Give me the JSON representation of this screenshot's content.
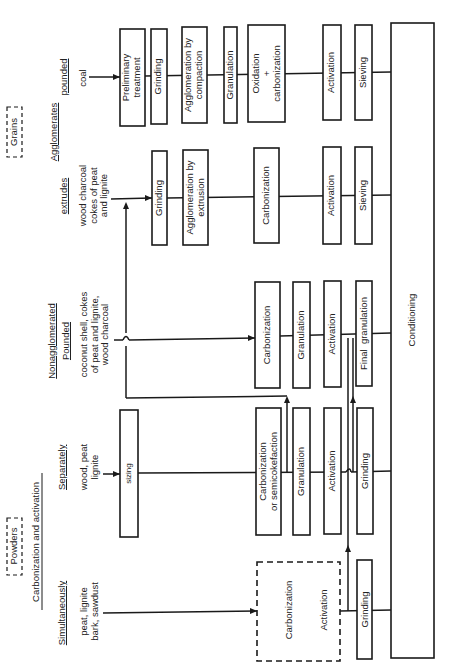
{
  "legend": {
    "grains": "Grains",
    "powders": "Powders",
    "agglomerates": "Agglomerates",
    "nonagglomerated": "Nonagglomerated",
    "carbonization_and_activation": "Carbonization and activation"
  },
  "rows": [
    {
      "category": "pounded",
      "feed": "coal",
      "steps": [
        "Preliminary treatment",
        "Grinding",
        "Agglomeration by compaction",
        "Granulation",
        "Oxidation + carbonization",
        "Activation",
        "Sieving"
      ]
    },
    {
      "category": "extrudes",
      "feed": "wood charcoal cokes of peat and lignite",
      "steps": [
        "Grinding",
        "Agglomeration by extrusion",
        "Carbonization",
        "Activation",
        "Sieving"
      ]
    },
    {
      "category": "Pounded",
      "feed": "coconut shell, cokes of peat and lignite, wood charcoal",
      "steps": [
        "Carbonization",
        "Granulation",
        "Activation",
        "Final granulation"
      ]
    },
    {
      "category": "Separately",
      "feed": "wood, peat lignite",
      "steps": [
        "sizing",
        "Carbonization or semicokefaction",
        "Granulation",
        "Activation",
        "Grinding"
      ]
    },
    {
      "category": "Simultaneously",
      "feed": "peat, lignite bark, sawdust",
      "steps": [
        "Carbonization",
        "Activation",
        "Grinding"
      ]
    }
  ],
  "final_step": "Conditioning",
  "text": {
    "r1_cat": "pounded",
    "r1_feed": "coal",
    "r1_s1a": "Preliminary",
    "r1_s1b": "treatment",
    "r1_s2": "Grinding",
    "r1_s3a": "Agglomeration by",
    "r1_s3b": "compaction",
    "r1_s4": "Granulation",
    "r1_s5a": "Oxidation",
    "r1_s5b": "+",
    "r1_s5c": "carbonization",
    "r1_s6": "Activation",
    "r1_s7": "Sieving",
    "r2_cat": "extrudes",
    "r2_f1": "wood charcoal",
    "r2_f2": "cokes of peat",
    "r2_f3": "and lignite",
    "r2_s1": "Grinding",
    "r2_s2a": "Agglomeration by",
    "r2_s2b": "extrusion",
    "r2_s3": "Carbonization",
    "r2_s4": "Activation",
    "r2_s5": "Sieving",
    "r3_cat": "Pounded",
    "r3_f1": "coconut shell, cokes",
    "r3_f2": "of peat and lignite,",
    "r3_f3": "wood charcoal",
    "r3_s1": "Carbonization",
    "r3_s2": "Granulation",
    "r3_s3": "Activation",
    "r3_s4": "Final  granulation",
    "r4_cat": "Separately",
    "r4_f1": "wood, peat",
    "r4_f2": "lignite",
    "r4_s0": "sizing",
    "r4_s1a": "Carbonization",
    "r4_s1b": "or semicokefaction",
    "r4_s2": "Granulation",
    "r4_s3": "Activation",
    "r4_s4": "Grinding",
    "r5_cat": "Simultaneously",
    "r5_f1": "peat, lignite",
    "r5_f2": "bark, sawdust",
    "r5_s1": "Carbonization",
    "r5_s1b": "Activation",
    "r5_s2": "Grinding",
    "conditioning": "Conditioning"
  }
}
